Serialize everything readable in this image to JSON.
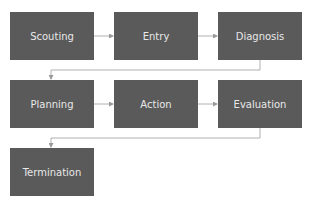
{
  "diagram": {
    "type": "process-flow",
    "nodes": [
      {
        "id": "scouting",
        "label": "Scouting"
      },
      {
        "id": "entry",
        "label": "Entry"
      },
      {
        "id": "diagnosis",
        "label": "Diagnosis"
      },
      {
        "id": "planning",
        "label": "Planning"
      },
      {
        "id": "action",
        "label": "Action"
      },
      {
        "id": "evaluation",
        "label": "Evaluation"
      },
      {
        "id": "termination",
        "label": "Termination"
      }
    ],
    "edges": [
      [
        "scouting",
        "entry"
      ],
      [
        "entry",
        "diagnosis"
      ],
      [
        "diagnosis",
        "planning"
      ],
      [
        "planning",
        "action"
      ],
      [
        "action",
        "evaluation"
      ],
      [
        "evaluation",
        "termination"
      ]
    ],
    "colors": {
      "box": "#5a5a5a",
      "text": "#e8e8e8",
      "connector": "#b0b0b0"
    }
  }
}
